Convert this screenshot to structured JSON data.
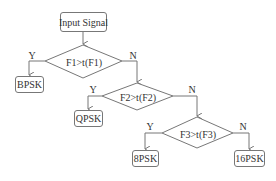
{
  "diagram": {
    "type": "flowchart",
    "start": {
      "label": "Input Signal"
    },
    "decisions": [
      {
        "label": "F1>t(F1)",
        "yes_label": "Y",
        "no_label": "N",
        "yes_target": "BPSK"
      },
      {
        "label": "F2>t(F2)",
        "yes_label": "Y",
        "no_label": "N",
        "yes_target": "QPSK"
      },
      {
        "label": "F3>t(F3)",
        "yes_label": "Y",
        "no_label": "N",
        "yes_target": "8PSK",
        "no_target": "16PSK"
      }
    ],
    "outputs": [
      {
        "label": "BPSK"
      },
      {
        "label": "QPSK"
      },
      {
        "label": "8PSK"
      },
      {
        "label": "16PSK"
      }
    ],
    "colors": {
      "stroke": "#777777",
      "text": "#333333",
      "background": "#ffffff"
    }
  }
}
